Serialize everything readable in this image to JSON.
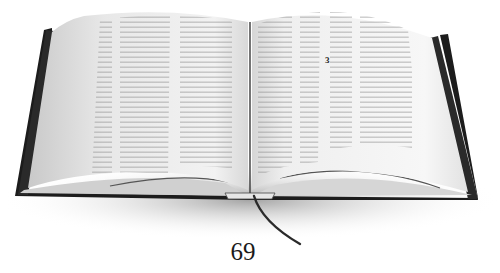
{
  "image": {
    "subject": "open book with ribbon bookmark",
    "style": "grayscale photograph",
    "colors": {
      "background": "#ffffff",
      "cover": "#1c1c1c",
      "page": "#eeeeee",
      "page_shade": "#c8c8c8",
      "text_lines": "#8a8a8a",
      "ribbon": "#2a2a2a"
    }
  },
  "book": {
    "right_page_marker": "3"
  },
  "caption": {
    "page_number": "69"
  }
}
